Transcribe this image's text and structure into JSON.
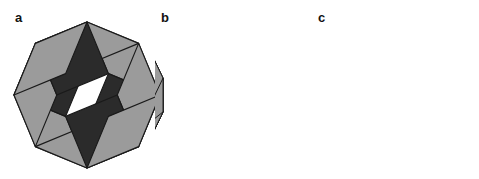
{
  "figure": {
    "width": 479,
    "height": 179,
    "background": "#ffffff",
    "caption_style": "bold lowercase letters"
  },
  "palette": {
    "dark": "#262626",
    "mid_dark": "#303030",
    "mid": "#6e6e6e",
    "light": "#9b9b9b",
    "lighter": "#c9c9c9",
    "lightest": "#ededed",
    "outline": "#1a1a1a",
    "label_color": "#121212"
  },
  "panels": [
    {
      "id": "a",
      "label": "a",
      "label_x": 15,
      "label_y": 11,
      "zones": 4,
      "sides": 8,
      "center_x": 87,
      "center_y": 95,
      "radius": 73,
      "start_angle": 22.5,
      "edge_len": 55.9,
      "shades": [
        "#9b9b9b",
        "#2b2b2b",
        "#2b2b2b"
      ],
      "stroke": "#1a1a1a",
      "stroke_width": 1.15
    },
    {
      "id": "b",
      "label": "b",
      "label_x": 161,
      "label_y": 11,
      "zones": 7,
      "sides": 14,
      "center_x": 244,
      "center_y": 95,
      "radius": 76,
      "start_angle": 12.857,
      "edge_len": 33.8,
      "shades": [
        "#9b9b9b",
        "#3a3a3a",
        "#9b9b9b",
        "#2b2b2b",
        "#2b2b2b",
        "#2b2b2b"
      ],
      "stroke": "#1a1a1a",
      "stroke_width": 1.0
    },
    {
      "id": "c",
      "label": "c",
      "label_x": 318,
      "label_y": 11,
      "zones": 10,
      "sides": 20,
      "center_x": 401,
      "center_y": 95,
      "radius": 78,
      "start_angle": 9,
      "edge_len": 24.4,
      "shades": [
        "#ececec",
        "#bdbdbd",
        "#8f8f8f",
        "#3a3a3a",
        "#2b2b2b",
        "#262626",
        "#232323",
        "#212121",
        "#202020"
      ],
      "stroke": "#1a1a1a",
      "stroke_width": 0.85
    }
  ],
  "labels": {
    "panel_a": "a",
    "panel_b": "b",
    "panel_c": "c"
  }
}
